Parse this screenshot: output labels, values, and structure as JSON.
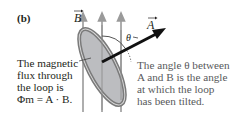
{
  "panel": {
    "label": "(b)"
  },
  "diagram": {
    "field_label": "B",
    "area_label": "A",
    "angle_label": "θ",
    "colors": {
      "field_lines": "#9a9a9a",
      "loop_fill": "#bcbdc0",
      "loop_ring": "#7a7a7a",
      "area_vector": "#111111",
      "dotted_arc": "#555555"
    }
  },
  "captions": {
    "left": {
      "line1": "The magnetic",
      "line2": "flux through",
      "line3": "the loop is",
      "line4": "Φm = A · B."
    },
    "right": {
      "line1": "The angle θ between",
      "line2": "A and B is the angle",
      "line3": "at which the loop",
      "line4": "has been tilted."
    }
  }
}
